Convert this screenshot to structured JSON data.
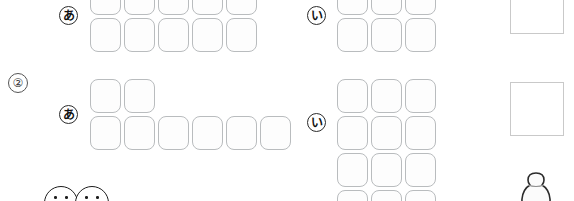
{
  "worksheet": {
    "sections": [
      {
        "id": "section-1",
        "number_label": "",
        "groups": [
          {
            "label": "あ",
            "label_name": "marker-a",
            "rows": [
              5,
              5
            ],
            "clipped_top": true
          },
          {
            "label": "い",
            "label_name": "marker-i",
            "rows": [
              3,
              3
            ],
            "clipped_top": true
          }
        ],
        "answer_box": {
          "label": "",
          "name": "answer-box-1"
        }
      },
      {
        "id": "section-2",
        "number_label": "②",
        "groups": [
          {
            "label": "あ",
            "label_name": "marker-a",
            "rows": [
              2,
              6
            ],
            "clipped_top": false
          },
          {
            "label": "い",
            "label_name": "marker-i",
            "rows": [
              3,
              3,
              3,
              3
            ],
            "clipped_bottom": true
          }
        ],
        "answer_box": {
          "label": "",
          "name": "answer-box-2"
        }
      }
    ],
    "faces": [
      {
        "name": "face-icon-left"
      },
      {
        "name": "face-icon-right"
      }
    ],
    "figure": {
      "name": "bottle-figure-icon"
    },
    "colors": {
      "tile_border": "#b9bcbe",
      "tile_fill": "#fdfdfd",
      "answer_border": "#c9c9c9",
      "ink": "#1d1d1d",
      "page_background": "#ffffff"
    }
  }
}
